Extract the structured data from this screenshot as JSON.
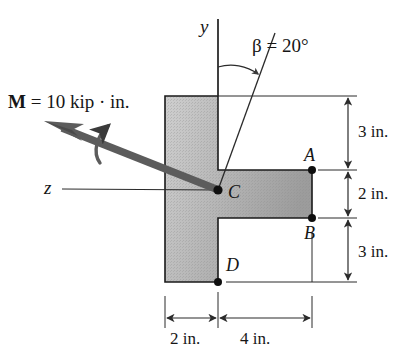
{
  "figure": {
    "moment_label": {
      "symbol": "M",
      "rest": " = 10 kip · in."
    },
    "angle_label": "β = 20°",
    "axis_y_label": "y",
    "axis_z_label": "z",
    "points": {
      "A": "A",
      "B": "B",
      "C": "C",
      "D": "D"
    },
    "dimensions": {
      "right_top": "3 in.",
      "right_middle": "2 in.",
      "right_bottom": "3 in.",
      "bottom_left": "2 in.",
      "bottom_right": "4 in."
    },
    "colors": {
      "section_fill_light": "#d8d8d8",
      "section_fill_dark": "#a7a7a7",
      "outline": "#1a1a1a",
      "moment_arrow": "#595959",
      "dimension_line": "#2b2b2b",
      "background": "#ffffff"
    },
    "geometry_inches": {
      "web_width": 2,
      "flange_length": 4,
      "above_flange": 3,
      "flange_height": 2,
      "below_flange": 3,
      "beta_degrees": 20,
      "moment_magnitude_kip_in": 10
    }
  }
}
